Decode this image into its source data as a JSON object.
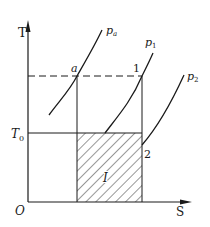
{
  "diagram": {
    "type": "T-S diagram",
    "axes": {
      "y_label": "T",
      "x_label": "S",
      "origin_label": "O",
      "y_tick_label": "T",
      "y_tick_sub": "0"
    },
    "isobars": [
      {
        "label": "p",
        "sub": "a"
      },
      {
        "label": "p",
        "sub": "1"
      },
      {
        "label": "p",
        "sub": "2"
      }
    ],
    "points": {
      "a": "a",
      "p1": "1",
      "p2": "2"
    },
    "region_label": "I",
    "colors": {
      "ink": "#1a1a1a",
      "background": "#ffffff"
    }
  }
}
